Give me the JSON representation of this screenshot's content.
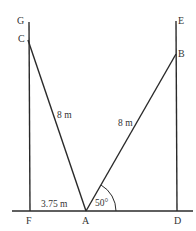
{
  "diagram": {
    "type": "geometry-ladder-problem",
    "points": {
      "G": {
        "label": "G"
      },
      "C": {
        "label": "C"
      },
      "F": {
        "label": "F"
      },
      "A": {
        "label": "A"
      },
      "D": {
        "label": "D"
      },
      "B": {
        "label": "B"
      },
      "E": {
        "label": "E"
      }
    },
    "measurements": {
      "CA": "8 m",
      "AB": "8 m",
      "FA": "3.75 m",
      "angle_BAD": "50°"
    },
    "colors": {
      "line": "#2a2a2a",
      "text": "#333333",
      "background": "#ffffff"
    }
  }
}
